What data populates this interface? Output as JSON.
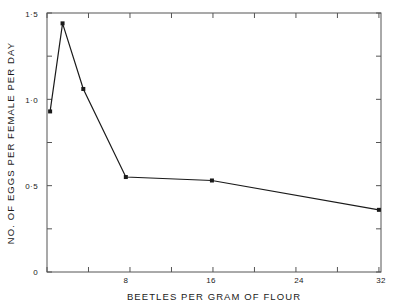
{
  "chart_data": {
    "type": "line",
    "title": "",
    "xlabel": "BEETLES   PER   GRAM   OF   FLOUR",
    "ylabel": "NO.  OF  EGGS  PER  FEMALE  PER  DAY",
    "xlim": [
      0,
      32.2
    ],
    "ylim": [
      0,
      1.5
    ],
    "xticks": [
      0,
      4,
      8,
      12,
      16,
      20,
      24,
      28,
      32
    ],
    "xticklabels": [
      "",
      "",
      "8",
      "",
      "16",
      "",
      "24",
      "",
      "32"
    ],
    "yticks": [
      0,
      0.25,
      0.5,
      0.75,
      1.0,
      1.25,
      1.5
    ],
    "yticklabels": [
      "0",
      "",
      "0·5",
      "",
      "1·0",
      "",
      "1·5"
    ],
    "grid": false,
    "legend": false,
    "frame": "box",
    "marker": "square",
    "line_color": "#1a1a1a",
    "series": [
      {
        "name": "eggs per female per day",
        "x": [
          0.3,
          1.5,
          3.5,
          7.6,
          15.9,
          32.0
        ],
        "values": [
          0.93,
          1.44,
          1.06,
          0.55,
          0.53,
          0.36
        ]
      }
    ]
  },
  "axis": {
    "x_title": "BEETLES   PER   GRAM   OF   FLOUR",
    "y_title": "NO.  OF  EGGS  PER  FEMALE  PER  DAY",
    "x_tick_8": "8",
    "x_tick_16": "16",
    "x_tick_24": "24",
    "x_tick_32": "32",
    "y_tick_0": "0",
    "y_tick_05": "0·5",
    "y_tick_10": "1·0",
    "y_tick_15": "1·5"
  }
}
